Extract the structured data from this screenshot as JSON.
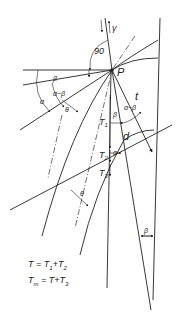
{
  "diagram": {
    "point_label": "P",
    "labels": {
      "right_angle": "90",
      "gamma": "γ",
      "beta_top": "β",
      "alpha": "α",
      "alpha_minus_beta_left": "α−β",
      "theta_upper": "θ",
      "t": "t",
      "T1": "T",
      "T1_sub": "1",
      "beta_mid": "β",
      "alpha_minus_beta_mid": "α−β",
      "d": "d",
      "T2": "T",
      "T2_sub": "2",
      "alpha_small": "α",
      "T3": "T",
      "T3_sub": "3",
      "theta_lower": "θ",
      "beta_bottom": "β"
    },
    "formulas": [
      {
        "lhs": "T",
        "lhs_sub": "",
        "rhs": "= T",
        "rhs_sub1": "1",
        "plus": "+T",
        "rhs_sub2": "2"
      },
      {
        "lhs": "T",
        "lhs_sub": "m",
        "rhs": "= T",
        "rhs_sub1": "",
        "plus": "+T",
        "rhs_sub2": "3"
      }
    ]
  }
}
